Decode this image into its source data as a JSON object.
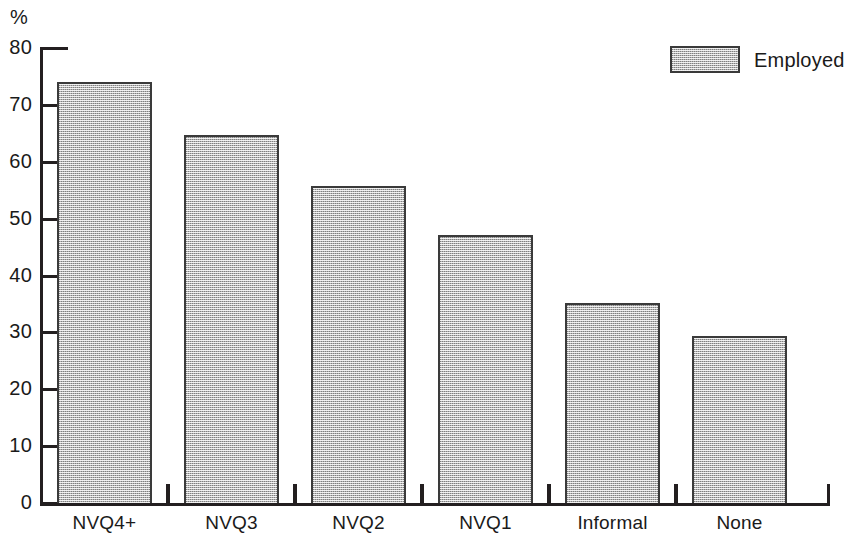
{
  "chart_data": {
    "type": "bar",
    "title": "",
    "subtitle": "",
    "xlabel": "",
    "ylabel": "%",
    "categories": [
      "NVQ4+",
      "NVQ3",
      "NVQ2",
      "NVQ1",
      "Informal",
      "None"
    ],
    "series": [
      {
        "name": "Employed",
        "values": [
          74.0,
          64.7,
          55.8,
          47.1,
          35.1,
          29.3
        ]
      }
    ],
    "values": [
      74.0,
      64.7,
      55.8,
      47.1,
      35.1,
      29.3
    ],
    "ylim": [
      0,
      80
    ],
    "ytick_values": [
      0,
      10,
      20,
      30,
      40,
      50,
      60,
      70,
      80
    ],
    "ytick_labels": [
      "0",
      "10",
      "20",
      "30",
      "40",
      "50",
      "60",
      "70",
      "80"
    ],
    "grid": false,
    "legend": {
      "position": "top-right",
      "entries": [
        {
          "label": "Employed",
          "color": "#b6b6b6"
        }
      ]
    },
    "annotations": [],
    "colors": {
      "bar_fill": "#b6b6b6",
      "bar_border": "#3a3a3a",
      "axis": "#231f20",
      "text": "#1a1a1a",
      "background": "#ffffff"
    }
  }
}
